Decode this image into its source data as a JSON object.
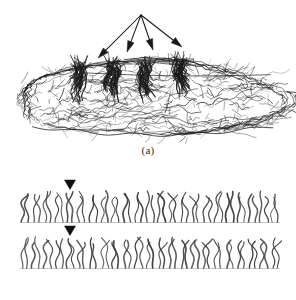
{
  "figure": {
    "ink_color": "#1a1a1a",
    "fiber_color": "#3a3a3a",
    "background_color": "#ffffff",
    "panels": [
      {
        "id": "a",
        "caption": "(a)",
        "description": "Hand-drawn fleece mass with four arrows pointing to staple columns",
        "pointer": {
          "name": "four-arrow-pointer",
          "apex": [
            141,
            15
          ],
          "arrow_count": 4,
          "arrow_tips": [
            [
              98,
              58
            ],
            [
              127,
              52
            ],
            [
              153,
              50
            ],
            [
              182,
              47
            ]
          ]
        },
        "fleece": {
          "name": "fleece-mass",
          "outline_center": [
            150,
            100
          ],
          "outline_width": 268,
          "outline_height": 76,
          "staple_column_x": [
            78,
            112,
            145,
            180
          ]
        }
      },
      {
        "id": "b",
        "caption": "(b)",
        "description": "Two horizontal rows of crimped fibers, each marked by a downward triangle",
        "rows": [
          {
            "name": "fiber-row-1",
            "baseline_y": 222,
            "fiber_top_y": 192,
            "fiber_count": 46,
            "x_start": 22,
            "x_end": 278,
            "marker": {
              "name": "down-triangle-marker",
              "x": 70,
              "y": 180
            }
          },
          {
            "name": "fiber-row-2",
            "baseline_y": 268,
            "fiber_top_y": 238,
            "fiber_count": 46,
            "x_start": 22,
            "x_end": 278,
            "marker": {
              "name": "down-triangle-marker",
              "x": 70,
              "y": 226
            }
          }
        ]
      }
    ]
  },
  "captions": {
    "a": "(a)",
    "b": "(b)"
  }
}
